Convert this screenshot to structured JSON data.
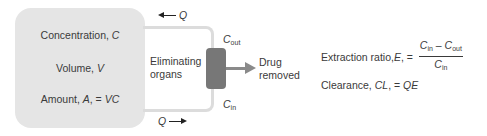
{
  "body_compartment": {
    "concentration": {
      "label": "Concentration, ",
      "symbol": "C"
    },
    "volume": {
      "label": "Volume, ",
      "symbol": "V"
    },
    "amount": {
      "label": "Amount, ",
      "symbol": "A",
      "suffix": ", = ",
      "expr": "VC"
    }
  },
  "flow": {
    "top": {
      "symbol": "Q",
      "direction": "left"
    },
    "bottom": {
      "symbol": "Q",
      "direction": "right"
    }
  },
  "organs": {
    "line1": "Eliminating",
    "line2": "organs"
  },
  "concentrations": {
    "out": {
      "symbol": "C",
      "sub": "out"
    },
    "in": {
      "symbol": "C",
      "sub": "in"
    }
  },
  "removed": {
    "line1": "Drug",
    "line2": "removed"
  },
  "equations": {
    "extraction": {
      "label": "Extraction ratio, ",
      "symbol": "E",
      "eq": ", = ",
      "numerator": {
        "a": "C",
        "a_sub": "in",
        "op": " – ",
        "b": "C",
        "b_sub": "out"
      },
      "denominator": {
        "a": "C",
        "a_sub": "in"
      }
    },
    "clearance": {
      "label": "Clearance, ",
      "symbol": "CL",
      "eq": ", = ",
      "expr": "QE"
    }
  },
  "colors": {
    "compartment": "#e5e5e5",
    "loop": "#dcdcdc",
    "organ": "#777777",
    "removal_arrow": "#8a8a8a",
    "text": "#3a3a3a"
  }
}
